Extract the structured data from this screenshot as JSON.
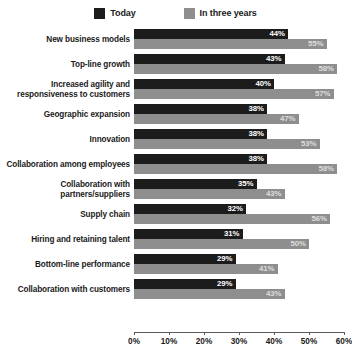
{
  "legend": {
    "entries": [
      {
        "label": "Today",
        "color": "#1c1c1c",
        "icon": "square-swatch-icon"
      },
      {
        "label": "In three years",
        "color": "#8e8e8e",
        "icon": "square-swatch-icon"
      }
    ]
  },
  "chart_data": {
    "type": "bar",
    "orientation": "horizontal",
    "title": "",
    "subtitle": "",
    "xlabel": "",
    "ylabel": "",
    "xlim": [
      0,
      60
    ],
    "xticks": [
      "0%",
      "10%",
      "20%",
      "30%",
      "40%",
      "50%",
      "60%"
    ],
    "xtick_values": [
      0,
      10,
      20,
      30,
      40,
      50,
      60
    ],
    "grid": false,
    "legend_position": "top-center",
    "value_suffix": "%",
    "categories": [
      "New business models",
      "Top-line growth",
      "Increased agility and responsiveness to customers",
      "Geographic expansion",
      "Innovation",
      "Collaboration among employees",
      "Collaboration with partners/suppliers",
      "Supply chain",
      "Hiring and retaining talent",
      "Bottom-line performance",
      "Collaboration with customers"
    ],
    "category_lines": [
      [
        "New business models"
      ],
      [
        "Top-line growth"
      ],
      [
        "Increased agility and",
        "responsiveness to customers"
      ],
      [
        "Geographic expansion"
      ],
      [
        "Innovation"
      ],
      [
        "Collaboration among employees"
      ],
      [
        "Collaboration with",
        "partners/suppliers"
      ],
      [
        "Supply chain"
      ],
      [
        "Hiring and retaining talent"
      ],
      [
        "Bottom-line performance"
      ],
      [
        "Collaboration with customers"
      ]
    ],
    "series": [
      {
        "name": "Today",
        "color": "#1c1c1c",
        "values": [
          44,
          43,
          40,
          38,
          38,
          38,
          35,
          32,
          31,
          29,
          29
        ],
        "labels": [
          "44%",
          "43%",
          "40%",
          "38%",
          "38%",
          "38%",
          "35%",
          "32%",
          "31%",
          "29%",
          "29%"
        ]
      },
      {
        "name": "In three years",
        "color": "#8e8e8e",
        "values": [
          55,
          58,
          57,
          47,
          53,
          58,
          43,
          56,
          50,
          41,
          43
        ],
        "labels": [
          "55%",
          "58%",
          "57%",
          "47%",
          "53%",
          "58%",
          "43%",
          "56%",
          "50%",
          "41%",
          "43%"
        ]
      }
    ]
  }
}
